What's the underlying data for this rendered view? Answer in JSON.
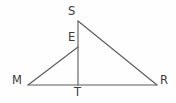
{
  "figure": {
    "kind": "geometry-diagram",
    "background_color": "#fefefe",
    "stroke_color": "#5a5a5a",
    "label_color": "#3b3b3b",
    "stroke_width": 1.1,
    "canvas": {
      "width": 176,
      "height": 103
    },
    "points": {
      "S": {
        "label": "S",
        "x": 78,
        "y": 21
      },
      "E": {
        "label": "E",
        "x": 78,
        "y": 47
      },
      "M": {
        "label": "M",
        "x": 28,
        "y": 85
      },
      "T": {
        "label": "T",
        "x": 78,
        "y": 85
      },
      "R": {
        "label": "R",
        "x": 157,
        "y": 85
      }
    },
    "segments": [
      {
        "name": "MR",
        "from": "M",
        "to": "R"
      },
      {
        "name": "SR",
        "from": "S",
        "to": "R"
      },
      {
        "name": "ST",
        "from": "S",
        "to": "T"
      },
      {
        "name": "ME",
        "from": "M",
        "to": "E"
      }
    ],
    "labels": [
      {
        "id": "S",
        "text": "S"
      },
      {
        "id": "E",
        "text": "E"
      },
      {
        "id": "M",
        "text": "M"
      },
      {
        "id": "T",
        "text": "T"
      },
      {
        "id": "R",
        "text": "R"
      }
    ]
  }
}
